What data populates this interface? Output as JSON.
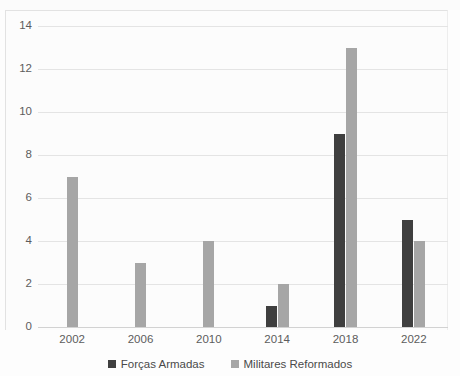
{
  "chart_data": {
    "type": "bar",
    "title": "",
    "subtitle": "",
    "xlabel": "",
    "ylabel": "",
    "categories": [
      "2002",
      "2006",
      "2010",
      "2014",
      "2018",
      "2022"
    ],
    "series": [
      {
        "name": "Forças Armadas",
        "color": "#3f3f3f",
        "values": [
          0,
          0,
          0,
          1,
          9,
          5
        ]
      },
      {
        "name": "Militares Reformados",
        "color": "#a6a6a6",
        "values": [
          7,
          3,
          4,
          2,
          13,
          4
        ]
      }
    ],
    "ylim": [
      0,
      14
    ],
    "yticks": [
      "0",
      "2",
      "4",
      "6",
      "8",
      "10",
      "12",
      "14"
    ],
    "ytick_values": [
      0,
      2,
      4,
      6,
      8,
      10,
      12,
      14
    ],
    "grid": true,
    "legend_position": "bottom"
  }
}
